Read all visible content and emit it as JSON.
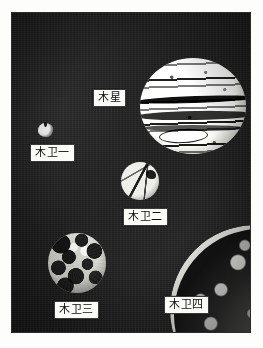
{
  "figure": {
    "name": "jupiter-and-galilean-moons-photograph",
    "background_color": "#ffffff",
    "plate_color": "#1b1b1b",
    "label_box_color": "#fbfbf7",
    "label_text_color": "#0d0d0d",
    "label_border_color": "#3a3a3a"
  },
  "bodies": [
    {
      "id": "jupiter",
      "label": "木星",
      "appearance": "large bright disk with dark horizontal cloud belts and an oval storm",
      "relative_size": "largest"
    },
    {
      "id": "io",
      "label": "木卫一",
      "appearance": "very small irregular bright blob",
      "relative_size": "smallest"
    },
    {
      "id": "europa",
      "label": "木卫二",
      "appearance": "small bright disk crossed by dark linear streaks",
      "relative_size": "small"
    },
    {
      "id": "ganymede",
      "label": "木卫三",
      "appearance": "medium disk with heavily mottled light and dark terrain",
      "relative_size": "medium"
    },
    {
      "id": "callisto",
      "label": "木卫四",
      "appearance": "dark heavily cratered surface with bright limb, cropped at corner",
      "relative_size": "large, cropped"
    }
  ],
  "labels": {
    "jupiter": "木星",
    "io": "木卫一",
    "europa": "木卫二",
    "ganymede": "木卫三",
    "callisto": "木卫四"
  }
}
